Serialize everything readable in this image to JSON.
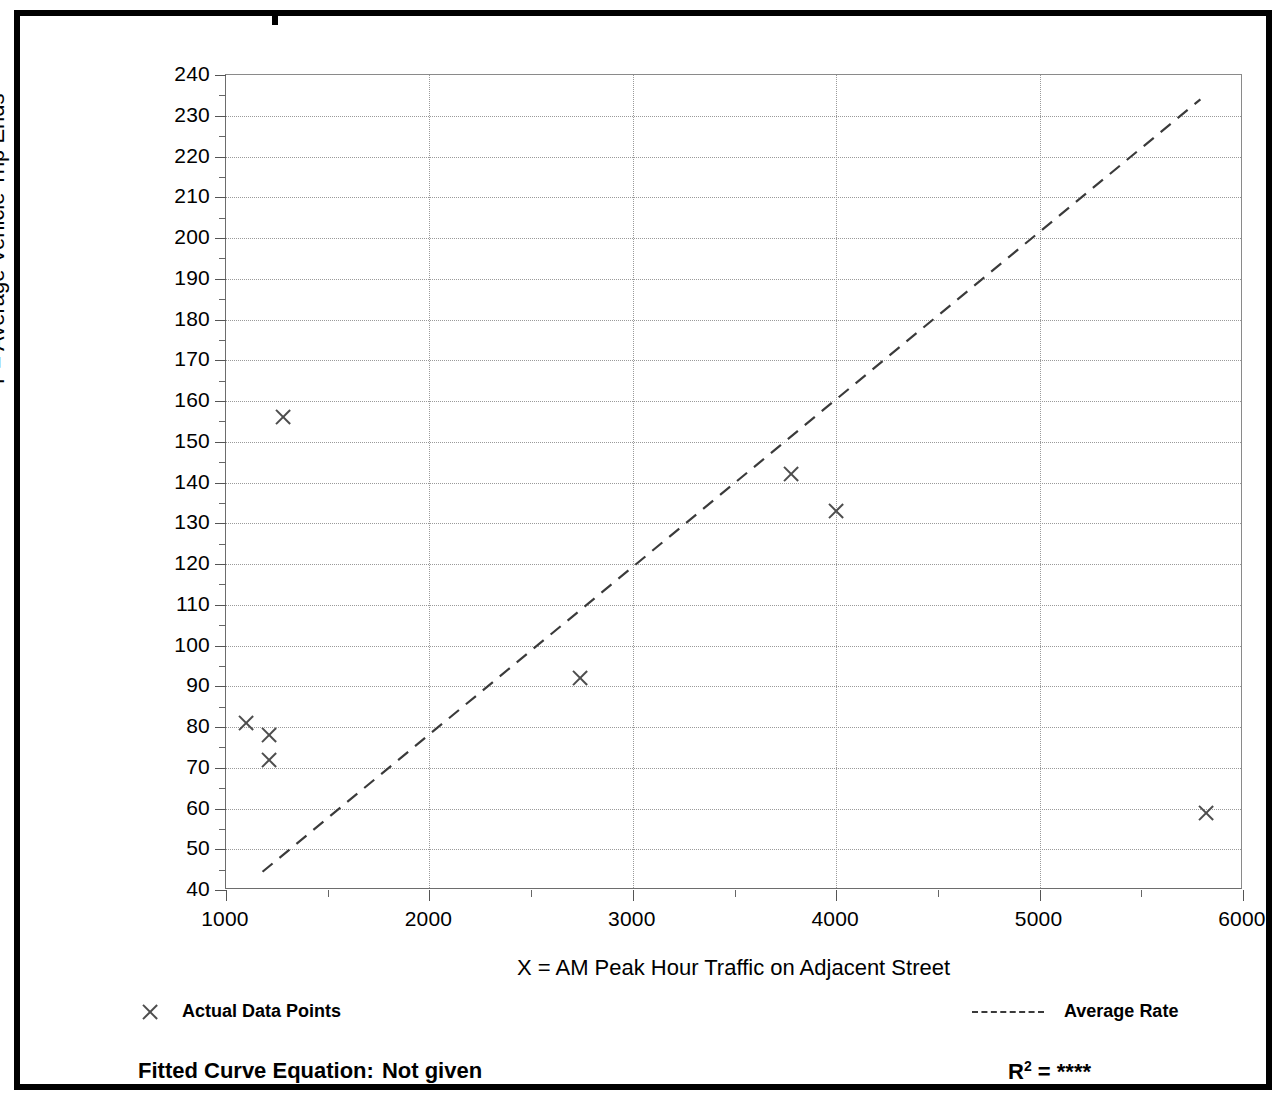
{
  "chart_data": {
    "type": "scatter",
    "title": "",
    "xlabel": "X = AM Peak Hour Traffic on Adjacent Street",
    "ylabel": "T = Average Vehicle Trip Ends",
    "xlim": [
      1000,
      6000
    ],
    "ylim": [
      40,
      240
    ],
    "x_tick_step": 1000,
    "x_minor_step": 500,
    "y_tick_step": 10,
    "y_minor_step": 5,
    "grid": true,
    "legend_position": "below-plot",
    "x_ticks": [
      1000,
      2000,
      3000,
      4000,
      5000,
      6000
    ],
    "y_ticks": [
      40,
      50,
      60,
      70,
      80,
      90,
      100,
      110,
      120,
      130,
      140,
      150,
      160,
      170,
      180,
      190,
      200,
      210,
      220,
      230,
      240
    ],
    "series": [
      {
        "name": "Actual Data Points",
        "type": "scatter",
        "marker": "x",
        "color": "#4d4d4d",
        "points": [
          {
            "x": 1100,
            "y": 81
          },
          {
            "x": 1210,
            "y": 78
          },
          {
            "x": 1210,
            "y": 72
          },
          {
            "x": 1280,
            "y": 156
          },
          {
            "x": 2740,
            "y": 92
          },
          {
            "x": 3780,
            "y": 142
          },
          {
            "x": 4000,
            "y": 133
          },
          {
            "x": 5820,
            "y": 59
          }
        ]
      },
      {
        "name": "Average Rate",
        "type": "line",
        "style": "dashed",
        "color": "#3a3a3a",
        "endpoints": [
          {
            "x": 1180,
            "y": 44
          },
          {
            "x": 5800,
            "y": 234
          }
        ]
      }
    ],
    "annotations": {
      "fitted_curve_equation": "Not given",
      "r_squared": "****"
    }
  },
  "axes": {
    "y_title": "T = Average Vehicle Trip Ends",
    "x_title": "X = AM Peak Hour Traffic on Adjacent Street"
  },
  "legend": {
    "data_points_label": "Actual Data Points",
    "average_rate_label": "Average Rate"
  },
  "footer": {
    "equation_label": "Fitted Curve Equation:",
    "equation_value": "Not given",
    "r_label": "R",
    "r_exponent": "2",
    "r_equals": "=",
    "r_value": "****"
  }
}
